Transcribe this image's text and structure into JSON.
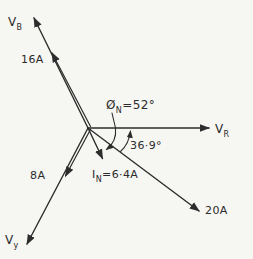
{
  "page": {
    "background": "#f6f6f3",
    "ink": "#2d2d2d"
  },
  "labels": {
    "vb": {
      "main": "V",
      "sub": "B"
    },
    "ib": "16A",
    "vr": {
      "main": "V",
      "sub": "R"
    },
    "vy": {
      "main": "V",
      "sub": "y"
    },
    "iy": "8A",
    "ir": "20A",
    "in": {
      "main": "I",
      "sub": "N",
      "value": "=6·4A"
    },
    "phi": {
      "main": "Ø",
      "sub": "N",
      "value": "=52°"
    },
    "angle_ir": "36·9°"
  },
  "diagram_data": {
    "type": "phasor_diagram",
    "phasors": [
      {
        "name": "V_B",
        "kind": "voltage",
        "direction_deg_from_VR": 116
      },
      {
        "name": "I_B",
        "kind": "current",
        "magnitude_A": 16,
        "in_phase_with": "V_B",
        "label": "16A"
      },
      {
        "name": "V_R",
        "kind": "voltage",
        "direction_deg_from_VR": 0
      },
      {
        "name": "I_R",
        "kind": "current",
        "magnitude_A": 20,
        "direction_deg_from_VR": -36.9,
        "label": "20A"
      },
      {
        "name": "V_Y",
        "kind": "voltage",
        "direction_deg_from_VR": -118
      },
      {
        "name": "I_Y",
        "kind": "current",
        "magnitude_A": 8,
        "in_phase_with": "V_Y",
        "label": "8A"
      },
      {
        "name": "I_N",
        "kind": "neutral_current",
        "magnitude_A": 6.4,
        "direction_deg_from_VR": -52,
        "label": "I_N=6·4A"
      }
    ],
    "angle_annotations": [
      {
        "label": "Ø_N=52°",
        "between": [
          "V_R",
          "I_N"
        ]
      },
      {
        "label": "36·9°",
        "between": [
          "V_R",
          "I_R"
        ]
      }
    ]
  }
}
